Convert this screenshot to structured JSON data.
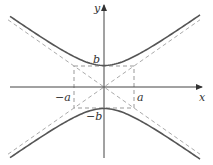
{
  "diagram": {
    "type": "hyperbola",
    "equation": "x^2/a^2 - y^2/b^2 = -1 (conjugate, opening up/down)",
    "labels": {
      "x_axis": "x",
      "y_axis": "y",
      "b_pos": "b",
      "b_neg": "−b",
      "a_pos": "a",
      "a_neg": "−a"
    },
    "colors": {
      "curve": "#555555",
      "asymptote": "#aaaaaa",
      "box": "#999999",
      "axis": "#444444"
    }
  }
}
